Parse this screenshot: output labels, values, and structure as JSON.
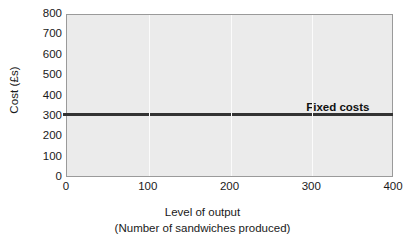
{
  "chart_data": {
    "type": "line",
    "title": "",
    "subtitle": "",
    "xlabel": "Level of output",
    "xlabel_sub": "(Number of sandwiches produced)",
    "ylabel": "Cost (£s)",
    "xlim": [
      0,
      400
    ],
    "ylim": [
      0,
      800
    ],
    "xticks": [
      0,
      100,
      200,
      300,
      400
    ],
    "xtick_labels": [
      "0",
      "100",
      "200",
      "300",
      "400"
    ],
    "yticks": [
      0,
      100,
      200,
      300,
      400,
      500,
      600,
      700,
      800
    ],
    "ytick_labels": [
      "0",
      "100",
      "200",
      "300",
      "400",
      "500",
      "600",
      "700",
      "800"
    ],
    "grid": "vertical-only",
    "legend": "none",
    "plot_background": "#ebebeb",
    "page_background": "#ffffff",
    "series": [
      {
        "name": "Fixed costs",
        "color": "#333333",
        "linewidth": 3,
        "x": [
          0,
          100,
          200,
          300,
          400
        ],
        "values": [
          310,
          310,
          310,
          310,
          310
        ]
      }
    ],
    "annotations": [
      {
        "text": "Fixed costs",
        "x": 370,
        "y": 345,
        "anchor": "end"
      }
    ]
  }
}
